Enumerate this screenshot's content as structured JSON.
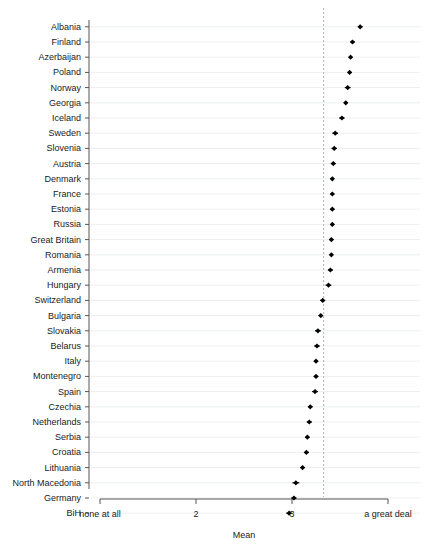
{
  "chart_data": {
    "type": "scatter",
    "title": "",
    "subtitle": "",
    "xlabel": "Mean",
    "ylabel": "",
    "orientation": "horizontal",
    "grid": true,
    "legend": null,
    "xlim": [
      1,
      4
    ],
    "xticks": [
      1,
      2,
      3,
      4
    ],
    "xtick_labels": [
      "none at all",
      "2",
      "3",
      "a great deal"
    ],
    "reference_line": {
      "value": 3.33,
      "style": "dashed",
      "color": "#b0b0b0"
    },
    "marker": {
      "shape": "diamond",
      "color": "#000000"
    },
    "error_bars": true,
    "categories": [
      "Albania",
      "Finland",
      "Azerbaijan",
      "Poland",
      "Norway",
      "Georgia",
      "Iceland",
      "Sweden",
      "Slovenia",
      "Austria",
      "Denmark",
      "France",
      "Estonia",
      "Russia",
      "Great Britain",
      "Romania",
      "Armenia",
      "Hungary",
      "Switzerland",
      "Bulgaria",
      "Slovakia",
      "Belarus",
      "Italy",
      "Montenegro",
      "Spain",
      "Czechia",
      "Netherlands",
      "Serbia",
      "Croatia",
      "Lithuania",
      "North Macedonia",
      "Germany",
      "BiH"
    ],
    "values": [
      3.71,
      3.63,
      3.61,
      3.6,
      3.58,
      3.56,
      3.52,
      3.45,
      3.44,
      3.43,
      3.42,
      3.42,
      3.42,
      3.42,
      3.41,
      3.41,
      3.4,
      3.38,
      3.32,
      3.3,
      3.27,
      3.26,
      3.25,
      3.25,
      3.24,
      3.19,
      3.18,
      3.16,
      3.15,
      3.11,
      3.04,
      3.02,
      2.97
    ],
    "errors": [
      0.025,
      0.022,
      0.018,
      0.02,
      0.03,
      0.02,
      0.028,
      0.03,
      0.028,
      0.026,
      0.018,
      0.02,
      0.022,
      0.02,
      0.022,
      0.018,
      0.026,
      0.03,
      0.026,
      0.024,
      0.03,
      0.028,
      0.022,
      0.024,
      0.03,
      0.024,
      0.026,
      0.024,
      0.026,
      0.024,
      0.036,
      0.026,
      0.03
    ]
  },
  "axis": {
    "x_title": "Mean"
  }
}
